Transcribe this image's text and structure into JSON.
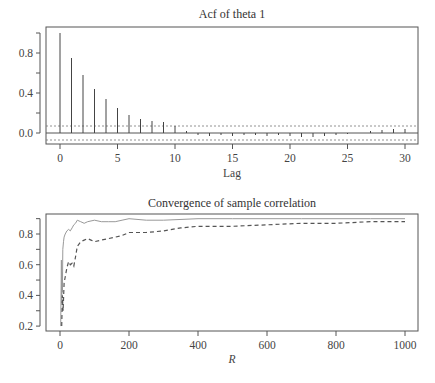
{
  "chart_data": [
    {
      "type": "bar",
      "subtype": "acf-stem",
      "title": "Acf of theta 1",
      "xlabel": "Lag",
      "ylabel": "",
      "xlim": [
        -1,
        31
      ],
      "ylim": [
        -0.1,
        1.03
      ],
      "xticks": [
        0,
        5,
        10,
        15,
        20,
        25,
        30
      ],
      "yticks": [
        "0.0",
        "0.4",
        "0.8"
      ],
      "grid": false,
      "confidence_band": 0.07,
      "lags": [
        0,
        1,
        2,
        3,
        4,
        5,
        6,
        7,
        8,
        9,
        10,
        11,
        12,
        13,
        14,
        15,
        16,
        17,
        18,
        19,
        20,
        21,
        22,
        23,
        24,
        25,
        26,
        27,
        28,
        29,
        30
      ],
      "values": [
        1.0,
        0.75,
        0.58,
        0.44,
        0.34,
        0.25,
        0.18,
        0.14,
        0.12,
        0.11,
        0.07,
        0.02,
        -0.02,
        -0.03,
        -0.02,
        -0.03,
        -0.02,
        -0.02,
        -0.03,
        -0.02,
        -0.03,
        -0.04,
        -0.04,
        -0.03,
        -0.02,
        -0.01,
        0.0,
        0.02,
        0.03,
        0.04,
        0.04
      ]
    },
    {
      "type": "line",
      "title": "Convergence of sample correlation",
      "xlabel": "R",
      "ylabel": "",
      "xlim": [
        -30,
        1030
      ],
      "ylim": [
        0.17,
        0.93
      ],
      "xticks": [
        0,
        200,
        400,
        600,
        800,
        1000
      ],
      "yticks": [
        "0.2",
        "0.4",
        "0.6",
        "0.8"
      ],
      "grid": false,
      "legend": null,
      "series": [
        {
          "name": "solid",
          "style": "solid",
          "x": [
            2,
            4,
            5,
            6,
            7,
            8,
            10,
            12,
            15,
            20,
            25,
            30,
            35,
            40,
            45,
            50,
            60,
            70,
            80,
            100,
            120,
            140,
            160,
            180,
            200,
            250,
            300,
            400,
            500,
            600,
            700,
            800,
            900,
            1000
          ],
          "y": [
            0.2,
            0.63,
            0.35,
            0.55,
            0.42,
            0.7,
            0.75,
            0.78,
            0.8,
            0.82,
            0.83,
            0.82,
            0.84,
            0.86,
            0.87,
            0.89,
            0.88,
            0.87,
            0.88,
            0.89,
            0.88,
            0.88,
            0.88,
            0.89,
            0.9,
            0.89,
            0.89,
            0.9,
            0.9,
            0.9,
            0.9,
            0.9,
            0.9,
            0.9
          ]
        },
        {
          "name": "dashed",
          "style": "dashed",
          "x": [
            5,
            7,
            9,
            12,
            15,
            20,
            25,
            30,
            35,
            40,
            45,
            50,
            60,
            70,
            80,
            90,
            100,
            120,
            140,
            160,
            180,
            200,
            250,
            300,
            350,
            400,
            500,
            600,
            700,
            800,
            900,
            1000
          ],
          "y": [
            0.2,
            0.4,
            0.3,
            0.48,
            0.52,
            0.58,
            0.62,
            0.6,
            0.61,
            0.59,
            0.65,
            0.72,
            0.75,
            0.76,
            0.77,
            0.76,
            0.75,
            0.76,
            0.77,
            0.78,
            0.79,
            0.81,
            0.81,
            0.82,
            0.84,
            0.85,
            0.85,
            0.86,
            0.87,
            0.87,
            0.88,
            0.88
          ]
        }
      ]
    }
  ],
  "footer_caption_clipped": ""
}
